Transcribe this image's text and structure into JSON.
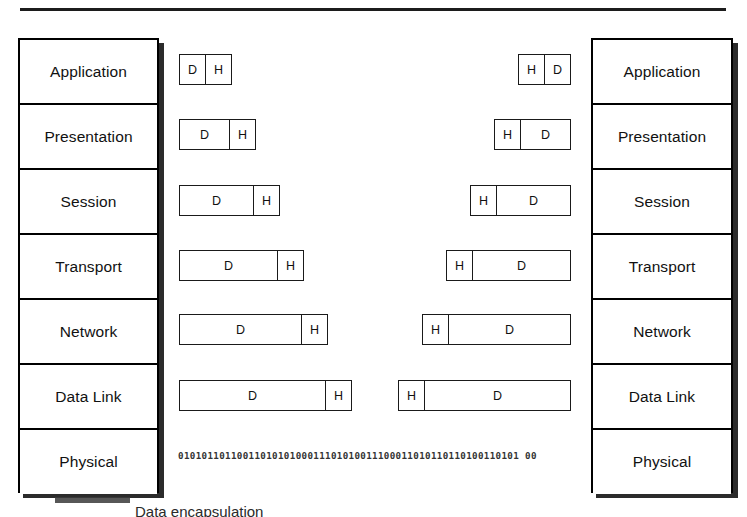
{
  "diagram": {
    "top_rule": true,
    "caption": "Data encapsulation"
  },
  "left_stack": {
    "name": "sender-protocol-stack",
    "layers": [
      {
        "label": "Application"
      },
      {
        "label": "Presentation"
      },
      {
        "label": "Session"
      },
      {
        "label": "Transport"
      },
      {
        "label": "Network"
      },
      {
        "label": "Data Link"
      },
      {
        "label": "Physical"
      }
    ]
  },
  "right_stack": {
    "name": "receiver-protocol-stack",
    "layers": [
      {
        "label": "Application"
      },
      {
        "label": "Presentation"
      },
      {
        "label": "Session"
      },
      {
        "label": "Transport"
      },
      {
        "label": "Network"
      },
      {
        "label": "Data Link"
      },
      {
        "label": "Physical"
      }
    ]
  },
  "left_packets": [
    {
      "layer": "Application",
      "data_label": "D",
      "header_label": "H",
      "left": 179,
      "top": 54,
      "width": 53,
      "header_width": 26
    },
    {
      "layer": "Presentation",
      "data_label": "D",
      "header_label": "H",
      "left": 179,
      "top": 119,
      "width": 77,
      "header_width": 26
    },
    {
      "layer": "Session",
      "data_label": "D",
      "header_label": "H",
      "left": 179,
      "top": 185,
      "width": 101,
      "header_width": 26
    },
    {
      "layer": "Transport",
      "data_label": "D",
      "header_label": "H",
      "left": 179,
      "top": 250,
      "width": 125,
      "header_width": 26
    },
    {
      "layer": "Network",
      "data_label": "D",
      "header_label": "H",
      "left": 179,
      "top": 314,
      "width": 149,
      "header_width": 26
    },
    {
      "layer": "Data Link",
      "data_label": "D",
      "header_label": "H",
      "left": 179,
      "top": 380,
      "width": 173,
      "header_width": 26
    }
  ],
  "right_packets": [
    {
      "layer": "Application",
      "data_label": "D",
      "header_label": "H",
      "right": 571,
      "top": 54,
      "width": 53,
      "header_width": 26
    },
    {
      "layer": "Presentation",
      "data_label": "D",
      "header_label": "H",
      "right": 571,
      "top": 119,
      "width": 77,
      "header_width": 26
    },
    {
      "layer": "Session",
      "data_label": "D",
      "header_label": "H",
      "right": 571,
      "top": 185,
      "width": 101,
      "header_width": 26
    },
    {
      "layer": "Transport",
      "data_label": "D",
      "header_label": "H",
      "right": 571,
      "top": 250,
      "width": 125,
      "header_width": 26
    },
    {
      "layer": "Network",
      "data_label": "D",
      "header_label": "H",
      "right": 571,
      "top": 314,
      "width": 149,
      "header_width": 26
    },
    {
      "layer": "Data Link",
      "data_label": "D",
      "header_label": "H",
      "right": 571,
      "top": 380,
      "width": 173,
      "header_width": 26
    }
  ],
  "physical": {
    "bitstream": "0101011011001101010100011101010011100011010110110100110101 00"
  },
  "colors": {
    "line": "#000000",
    "shadow": "#2b2b2b",
    "text": "#111111",
    "background": "#ffffff",
    "bitstream_text": "#333333"
  }
}
